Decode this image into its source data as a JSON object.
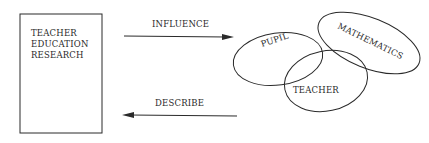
{
  "diagram": {
    "box": {
      "lines": [
        "TEACHER",
        "EDUCATION",
        "RESEARCH"
      ]
    },
    "arrows": {
      "influence": {
        "label": "INFLUENCE",
        "direction": "right"
      },
      "describe": {
        "label": "DESCRIBE",
        "direction": "left"
      }
    },
    "venn": {
      "pupil": {
        "label": "PUPIL"
      },
      "mathematics": {
        "label": "MATHEMATICS"
      },
      "teacher": {
        "label": "TEACHER"
      }
    },
    "colors": {
      "ink": "#2a2a2a",
      "background": "#ffffff"
    }
  }
}
